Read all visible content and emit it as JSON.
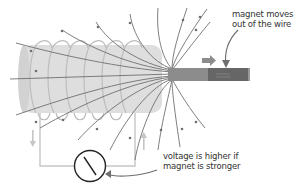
{
  "diagram": {
    "labels": {
      "magnet_line1": "magnet moves",
      "magnet_line2": "out of the wire",
      "voltage_line1": "voltage is higher if",
      "voltage_line2": "magnet is stronger"
    },
    "components": [
      "coil",
      "bar-magnet",
      "field-lines",
      "circuit-wire",
      "voltmeter",
      "motion-arrow",
      "current-arrows"
    ],
    "colors": {
      "coil_fill": "#dcdcdc",
      "coil_wire": "#b8b8b8",
      "field_line": "#707070",
      "magnet_light": "#8a8a8a",
      "magnet_dark": "#666666",
      "circuit_wire": "#c4c4c4",
      "meter_outline": "#222222",
      "text": "#333333",
      "arrow": "#8a8a8a"
    }
  }
}
